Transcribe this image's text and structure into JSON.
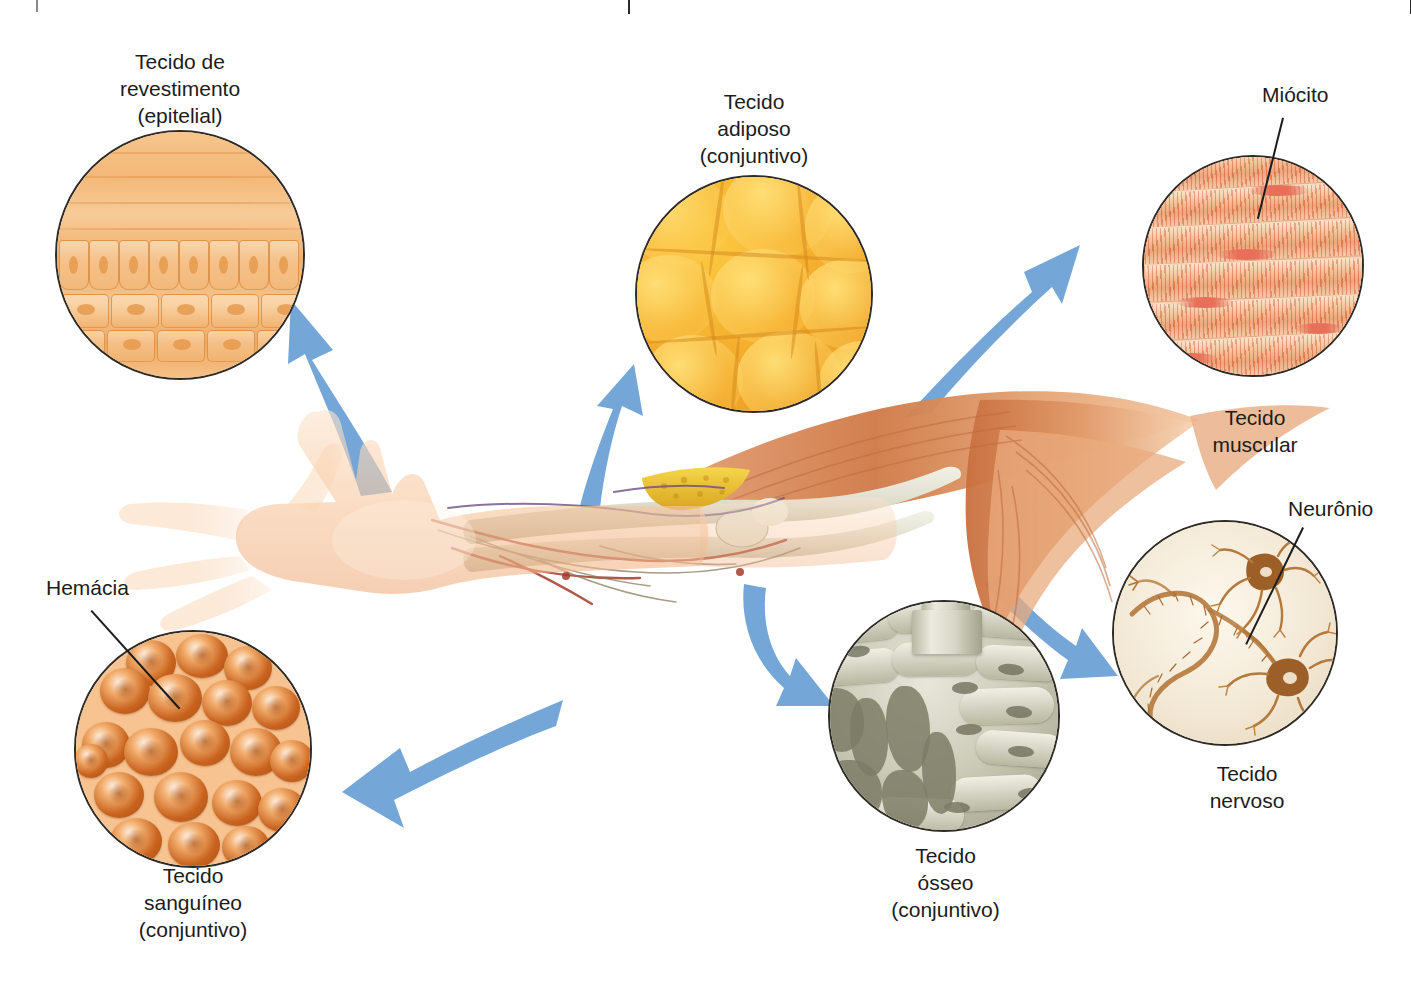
{
  "header": {
    "title": "Esquema de tecidos do corpo humano",
    "rule_icon": "vertical-rule-icon"
  },
  "figure": {
    "arrow_color": "#74a7d8",
    "outline_color": "#2e2a26"
  },
  "callouts": [
    {
      "id": "epitelial",
      "caption": "Tecido de\nrevestimento\n(epitelial)",
      "caption_lines": [
        "Tecido de",
        "revestimento",
        "(epitelial)"
      ],
      "circle_name": "micrograph-epithelial",
      "tissue_type": "epitelial",
      "colors": {
        "primary": "#f3b878",
        "secondary": "#f7cb98"
      }
    },
    {
      "id": "adiposo",
      "caption": "Tecido\nadiposo\n(conjuntivo)",
      "caption_lines": [
        "Tecido",
        "adiposo",
        "(conjuntivo)"
      ],
      "circle_name": "micrograph-adipose",
      "tissue_type": "conjuntivo",
      "colors": {
        "primary": "#f4a92a",
        "secondary": "#fcc943"
      }
    },
    {
      "id": "muscular",
      "caption": "Tecido\nmuscular",
      "caption_lines": [
        "Tecido",
        "muscular"
      ],
      "circle_name": "micrograph-muscle",
      "tissue_type": "muscular",
      "colors": {
        "primary": "#e8895a",
        "secondary": "#f9e0c9"
      }
    },
    {
      "id": "nervoso",
      "caption": "Tecido\nnervoso",
      "caption_lines": [
        "Tecido",
        "nervoso"
      ],
      "circle_name": "micrograph-nervous",
      "tissue_type": "nervoso",
      "colors": {
        "primary": "#b5793c",
        "secondary": "#fdf8ed"
      }
    },
    {
      "id": "osseo",
      "caption": "Tecido\nósseo\n(conjuntivo)",
      "caption_lines": [
        "Tecido",
        "ósseo",
        "(conjuntivo)"
      ],
      "circle_name": "micrograph-bone",
      "tissue_type": "conjuntivo",
      "colors": {
        "primary": "#9d9d87",
        "secondary": "#e7e6da"
      }
    },
    {
      "id": "sanguineo",
      "caption": "Tecido\nsanguíneo\n(conjuntivo)",
      "caption_lines": [
        "Tecido",
        "sanguíneo",
        "(conjuntivo)"
      ],
      "circle_name": "micrograph-blood",
      "tissue_type": "conjuntivo",
      "colors": {
        "primary": "#c9641f",
        "secondary": "#f6c391"
      }
    }
  ],
  "cell_labels": [
    {
      "id": "miocito",
      "text": "Miócito",
      "points_to": "micrograph-muscle"
    },
    {
      "id": "neuronio",
      "text": "Neurônio",
      "points_to": "micrograph-nervous"
    },
    {
      "id": "hemacia",
      "text": "Hemácia",
      "points_to": "micrograph-blood"
    }
  ]
}
